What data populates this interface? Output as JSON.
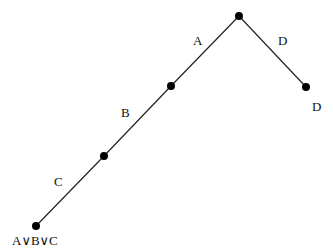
{
  "diagram": {
    "type": "tree",
    "nodes": [
      {
        "id": "root",
        "x": 239,
        "y": 16,
        "label": ""
      },
      {
        "id": "n1",
        "x": 171,
        "y": 86,
        "label": ""
      },
      {
        "id": "n2",
        "x": 104,
        "y": 156,
        "label": ""
      },
      {
        "id": "leaf_abc",
        "x": 36,
        "y": 226,
        "label": "A∨B∨C"
      },
      {
        "id": "leaf_d",
        "x": 306,
        "y": 87,
        "label": "D"
      }
    ],
    "edges": [
      {
        "from": "root",
        "to": "n1",
        "label": "A"
      },
      {
        "from": "n1",
        "to": "n2",
        "label": "B"
      },
      {
        "from": "n2",
        "to": "leaf_abc",
        "label": "C"
      },
      {
        "from": "root",
        "to": "leaf_d",
        "label": "D"
      }
    ],
    "labels": {
      "edge_a": "A",
      "edge_b": "B",
      "edge_c": "C",
      "edge_d": "D",
      "leaf_d": "D",
      "leaf_abc": "A∨B∨C"
    }
  }
}
